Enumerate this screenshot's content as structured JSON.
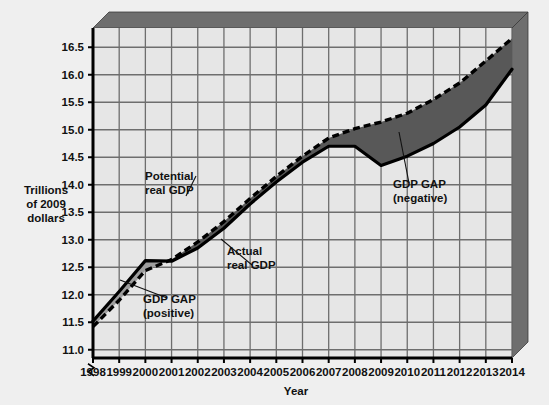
{
  "chart_data": {
    "type": "line",
    "title": "",
    "xlabel": "Year",
    "ylabel": "Trillions of 2009 dollars",
    "ylabel_lines": [
      "Trillions",
      "of 2009",
      "dollars"
    ],
    "xlim": [
      1998,
      2014
    ],
    "ylim": [
      10.85,
      16.85
    ],
    "yticks": [
      "11.0",
      "11.5",
      "12.0",
      "12.5",
      "13.0",
      "13.5",
      "14.0",
      "14.5",
      "15.0",
      "15.5",
      "16.0",
      "16.5"
    ],
    "ytick_values": [
      11.0,
      11.5,
      12.0,
      12.5,
      13.0,
      13.5,
      14.0,
      14.5,
      15.0,
      15.5,
      16.0,
      16.5
    ],
    "xticks": [
      "1998",
      "1999",
      "2000",
      "2001",
      "2002",
      "2003",
      "2004",
      "2005",
      "2006",
      "2007",
      "2008",
      "2009",
      "2010",
      "2011",
      "2012",
      "2013",
      "2014"
    ],
    "xtick_values": [
      1998,
      1999,
      2000,
      2001,
      2002,
      2003,
      2004,
      2005,
      2006,
      2007,
      2008,
      2009,
      2010,
      2011,
      2012,
      2013,
      2014
    ],
    "grid": true,
    "axis_break": true,
    "legend_position": "annotations-inline",
    "x": [
      1998,
      1999,
      2000,
      2001,
      2002,
      2003,
      2004,
      2005,
      2006,
      2007,
      2008,
      2009,
      2010,
      2011,
      2012,
      2013,
      2014
    ],
    "series": [
      {
        "name": "Actual real GDP",
        "style": "solid",
        "color": "#000000",
        "values": [
          11.52,
          12.06,
          12.62,
          12.61,
          12.85,
          13.21,
          13.65,
          14.05,
          14.41,
          14.7,
          14.7,
          14.35,
          14.52,
          14.75,
          15.05,
          15.45,
          16.1
        ]
      },
      {
        "name": "Potential real GDP",
        "style": "dashed",
        "color": "#000000",
        "values": [
          11.42,
          11.9,
          12.44,
          12.64,
          12.96,
          13.33,
          13.75,
          14.15,
          14.52,
          14.85,
          15.02,
          15.14,
          15.3,
          15.55,
          15.85,
          16.25,
          16.66
        ]
      }
    ],
    "regions": [
      {
        "name": "GDP GAP (positive)",
        "fill": "#9d9d9d",
        "from_year": 1998,
        "to_year": 2000.8,
        "description": "Actual real GDP above potential real GDP"
      },
      {
        "name": "GDP GAP (negative)",
        "fill": "#585858",
        "from_year": 2000.8,
        "to_year": 2014,
        "description": "Actual real GDP below potential real GDP"
      }
    ],
    "annotations": [
      {
        "id": "potential-real-gdp",
        "lines": [
          "Potential",
          "real GDP"
        ],
        "text": "Potential real GDP"
      },
      {
        "id": "actual-real-gdp",
        "lines": [
          "Actual",
          "real GDP"
        ],
        "text": "Actual real GDP"
      },
      {
        "id": "gdp-gap-positive",
        "lines": [
          "GDP GAP",
          "(positive)"
        ],
        "text": "GDP GAP (positive)"
      },
      {
        "id": "gdp-gap-negative",
        "lines": [
          "GDP GAP",
          "(negative)"
        ],
        "text": "GDP GAP (negative)"
      }
    ],
    "colors": {
      "page_background": "#efefef",
      "plot_background": "#e6e6e6",
      "gridline": "#6e6e6e",
      "axis": "#000000",
      "bevel": "#6e6e6e",
      "gap_positive_fill": "#9d9d9d",
      "gap_negative_fill": "#585858"
    }
  }
}
